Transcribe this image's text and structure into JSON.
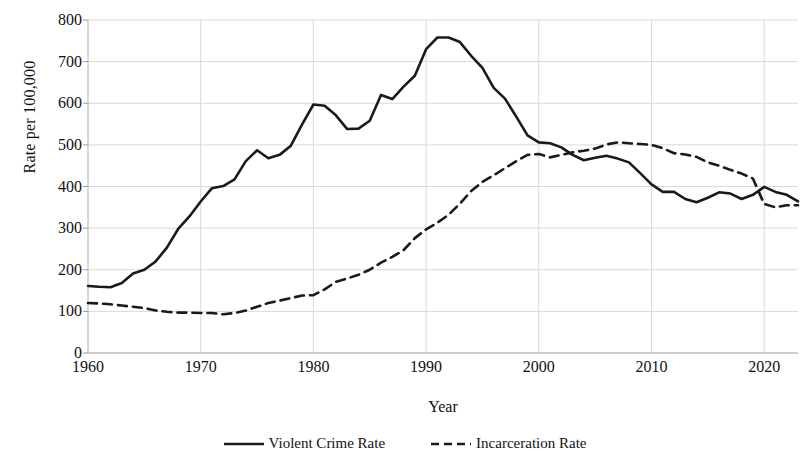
{
  "chart_data": {
    "type": "line",
    "title": "",
    "xlabel": "Year",
    "ylabel": "Rate per 100,000",
    "xlim": [
      1960,
      2023
    ],
    "ylim": [
      0,
      800
    ],
    "grid": true,
    "legend_position": "bottom",
    "y_ticks": [
      0,
      100,
      200,
      300,
      400,
      500,
      600,
      700,
      800
    ],
    "y_tick_labels": [
      "0",
      "100",
      "200",
      "300",
      "400",
      "500",
      "600",
      "700",
      "800"
    ],
    "x_ticks": [
      1960,
      1970,
      1980,
      1990,
      2000,
      2010,
      2020
    ],
    "x_tick_labels": [
      "1960",
      "1970",
      "1980",
      "1990",
      "2000",
      "2010",
      "2020"
    ],
    "x": [
      1960,
      1961,
      1962,
      1963,
      1964,
      1965,
      1966,
      1967,
      1968,
      1969,
      1970,
      1971,
      1972,
      1973,
      1974,
      1975,
      1976,
      1977,
      1978,
      1979,
      1980,
      1981,
      1982,
      1983,
      1984,
      1985,
      1986,
      1987,
      1988,
      1989,
      1990,
      1991,
      1992,
      1993,
      1994,
      1995,
      1996,
      1997,
      1998,
      1999,
      2000,
      2001,
      2002,
      2003,
      2004,
      2005,
      2006,
      2007,
      2008,
      2009,
      2010,
      2011,
      2012,
      2013,
      2014,
      2015,
      2016,
      2017,
      2018,
      2019,
      2020,
      2021,
      2022,
      2023
    ],
    "series": [
      {
        "name": "Violent Crime Rate",
        "style": "solid",
        "color": "#1a1a1a",
        "values": [
          161,
          159,
          158,
          168,
          191,
          200,
          220,
          253,
          298,
          328,
          364,
          396,
          401,
          417,
          461,
          487,
          468,
          476,
          498,
          549,
          597,
          594,
          571,
          538,
          539,
          558,
          620,
          610,
          640,
          666,
          730,
          758,
          758,
          747,
          714,
          685,
          637,
          611,
          568,
          523,
          506,
          504,
          494,
          476,
          463,
          469,
          474,
          467,
          458,
          432,
          405,
          387,
          387,
          370,
          362,
          373,
          386,
          383,
          370,
          380,
          399,
          387,
          380,
          364
        ]
      },
      {
        "name": "Incarceration Rate",
        "style": "dashed",
        "color": "#1a1a1a",
        "values": [
          120,
          119,
          117,
          114,
          111,
          108,
          102,
          99,
          97,
          97,
          96,
          96,
          93,
          96,
          102,
          111,
          120,
          126,
          132,
          138,
          139,
          153,
          171,
          179,
          188,
          200,
          217,
          231,
          247,
          276,
          297,
          313,
          332,
          359,
          389,
          411,
          427,
          444,
          461,
          476,
          478,
          470,
          476,
          482,
          486,
          491,
          501,
          506,
          504,
          502,
          500,
          492,
          480,
          477,
          471,
          458,
          450,
          440,
          431,
          419,
          358,
          350,
          355,
          355
        ]
      }
    ]
  },
  "legend": {
    "items": [
      {
        "label": "Violent Crime Rate",
        "style": "solid"
      },
      {
        "label": "Incarceration Rate",
        "style": "dashed"
      }
    ]
  }
}
